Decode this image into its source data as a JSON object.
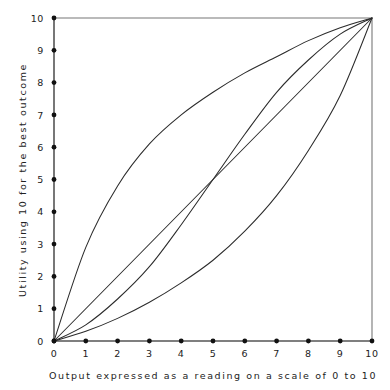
{
  "chart_data": {
    "type": "line",
    "title": "",
    "xlabel": "Output expressed as a reading on a scale of 0 to 10",
    "ylabel": "Utility using 10 for the best outcome",
    "xlim": [
      0,
      10
    ],
    "ylim": [
      0,
      10
    ],
    "grid": false,
    "legend": "none",
    "x_ticks": [
      "0",
      "1",
      "2",
      "3",
      "4",
      "5",
      "6",
      "7",
      "8",
      "9",
      "10"
    ],
    "y_ticks": [
      "0",
      "1",
      "2",
      "3",
      "4",
      "5",
      "6",
      "7",
      "8",
      "9",
      "10"
    ],
    "x": [
      0,
      1,
      2,
      3,
      4,
      5,
      6,
      7,
      8,
      9,
      10
    ],
    "series": [
      {
        "name": "concave risk-averse utility",
        "shape": "concave",
        "values": [
          0,
          2.9,
          4.8,
          6.1,
          7.0,
          7.7,
          8.3,
          8.8,
          9.3,
          9.7,
          10
        ]
      },
      {
        "name": "linear risk-neutral utility",
        "shape": "linear",
        "values": [
          0,
          1,
          2,
          3,
          4,
          5,
          6,
          7,
          8,
          9,
          10
        ]
      },
      {
        "name": "S-shaped utility",
        "shape": "s-curve",
        "values": [
          0,
          0.5,
          1.3,
          2.3,
          3.6,
          5.0,
          6.4,
          7.7,
          8.7,
          9.5,
          10
        ]
      },
      {
        "name": "convex risk-seeking utility",
        "shape": "convex",
        "values": [
          0,
          0.3,
          0.7,
          1.2,
          1.8,
          2.5,
          3.4,
          4.5,
          5.9,
          7.6,
          10
        ]
      }
    ],
    "colors": {
      "curve": "#2b2b2b",
      "axis": "#555555",
      "frame": "#777777",
      "tick_dot": "#111111",
      "background": "#ffffff"
    }
  }
}
